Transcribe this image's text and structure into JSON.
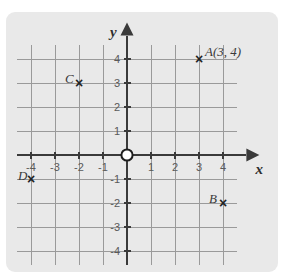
{
  "figure": {
    "kind": "cartesian-coordinate-plane",
    "background_color": "#ffffff",
    "panel_color": "#e9e9e9",
    "grid_color": "#9a9a9a",
    "axis_color": "#3a3a3a",
    "text_color": "#4a4a4a"
  },
  "axes": {
    "x_axis_label": "x",
    "y_axis_label": "y",
    "x_range": [
      -4.6,
      4.6
    ],
    "y_range": [
      -4.6,
      4.6
    ],
    "grid": true,
    "origin_marker": "open-circle",
    "x_ticks": [
      {
        "value": -4,
        "label": "-4"
      },
      {
        "value": -3,
        "label": "-3"
      },
      {
        "value": -2,
        "label": "-2"
      },
      {
        "value": -1,
        "label": "-1"
      },
      {
        "value": 1,
        "label": "1"
      },
      {
        "value": 2,
        "label": "2"
      },
      {
        "value": 3,
        "label": "3"
      },
      {
        "value": 4,
        "label": "4"
      }
    ],
    "y_ticks": [
      {
        "value": 4,
        "label": "4"
      },
      {
        "value": 3,
        "label": "3"
      },
      {
        "value": 2,
        "label": "2"
      },
      {
        "value": 1,
        "label": "1"
      },
      {
        "value": -1,
        "label": "-1"
      },
      {
        "value": -2,
        "label": "-2"
      },
      {
        "value": -3,
        "label": "-3"
      },
      {
        "value": -4,
        "label": "-4"
      }
    ]
  },
  "points": [
    {
      "name": "A",
      "label": "A(3, 4)",
      "x": 3,
      "y": 4,
      "marker": "x",
      "label_dx": 6,
      "label_dy": -14
    },
    {
      "name": "B",
      "label": "B",
      "x": 4,
      "y": -2,
      "marker": "x",
      "label_dx": -14,
      "label_dy": -11
    },
    {
      "name": "C",
      "label": "C",
      "x": -2,
      "y": 3,
      "marker": "x",
      "label_dx": -14,
      "label_dy": -11
    },
    {
      "name": "D",
      "label": "D",
      "x": -4,
      "y": -1,
      "marker": "x",
      "label_dx": -13,
      "label_dy": -10
    }
  ]
}
